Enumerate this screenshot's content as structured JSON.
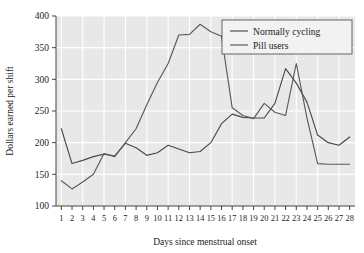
{
  "chart_data": {
    "type": "line",
    "title": "",
    "xlabel": "Days since menstrual onset",
    "ylabel": "Dollars earned per shift",
    "xlim": [
      0.5,
      28.5
    ],
    "ylim": [
      100,
      400
    ],
    "xticks": [
      1,
      2,
      3,
      4,
      5,
      6,
      7,
      8,
      9,
      10,
      11,
      12,
      13,
      14,
      15,
      16,
      17,
      18,
      19,
      20,
      21,
      22,
      23,
      24,
      25,
      26,
      27,
      28
    ],
    "xtick_labels": [
      "1",
      "2",
      "3",
      "4",
      "5",
      "6",
      "7",
      "8",
      "9",
      "10",
      "11",
      "12",
      "13",
      "14",
      "15",
      "16",
      "17",
      "18",
      "19",
      "20",
      "21",
      "22",
      "23",
      "24",
      "25",
      "26",
      "27",
      "28"
    ],
    "yticks": [
      100,
      150,
      200,
      250,
      300,
      350,
      400
    ],
    "ytick_labels": [
      "100",
      "150",
      "200",
      "250",
      "300",
      "350",
      "400"
    ],
    "grid": true,
    "grid_color": "#ffffff",
    "plot_background": "#e8e8e8",
    "legend_position": "top-right",
    "x": [
      1,
      2,
      3,
      4,
      5,
      6,
      7,
      8,
      9,
      10,
      11,
      12,
      13,
      14,
      15,
      16,
      17,
      18,
      19,
      20,
      21,
      22,
      23,
      24,
      25,
      26,
      27,
      28
    ],
    "series": [
      {
        "name": "Normally cycling",
        "color": "#4a4a4a",
        "values": [
          222,
          167,
          172,
          178,
          182,
          179,
          199,
          192,
          180,
          184,
          196,
          190,
          184,
          186,
          200,
          230,
          245,
          240,
          239,
          239,
          262,
          317,
          294,
          264,
          212,
          200,
          196,
          209
        ]
      },
      {
        "name": "Pill users",
        "color": "#5a5a5a",
        "values": [
          140,
          127,
          138,
          150,
          183,
          178,
          200,
          222,
          260,
          295,
          325,
          370,
          371,
          387,
          375,
          368,
          255,
          243,
          238,
          262,
          248,
          243,
          325,
          239,
          167,
          166,
          166,
          166
        ]
      }
    ]
  },
  "legend": {
    "items": [
      {
        "label": "Normally cycling"
      },
      {
        "label": "Pill users"
      }
    ]
  },
  "axes": {
    "y_title": "Dollars earned per shift",
    "x_title": "Days since menstrual onset"
  }
}
